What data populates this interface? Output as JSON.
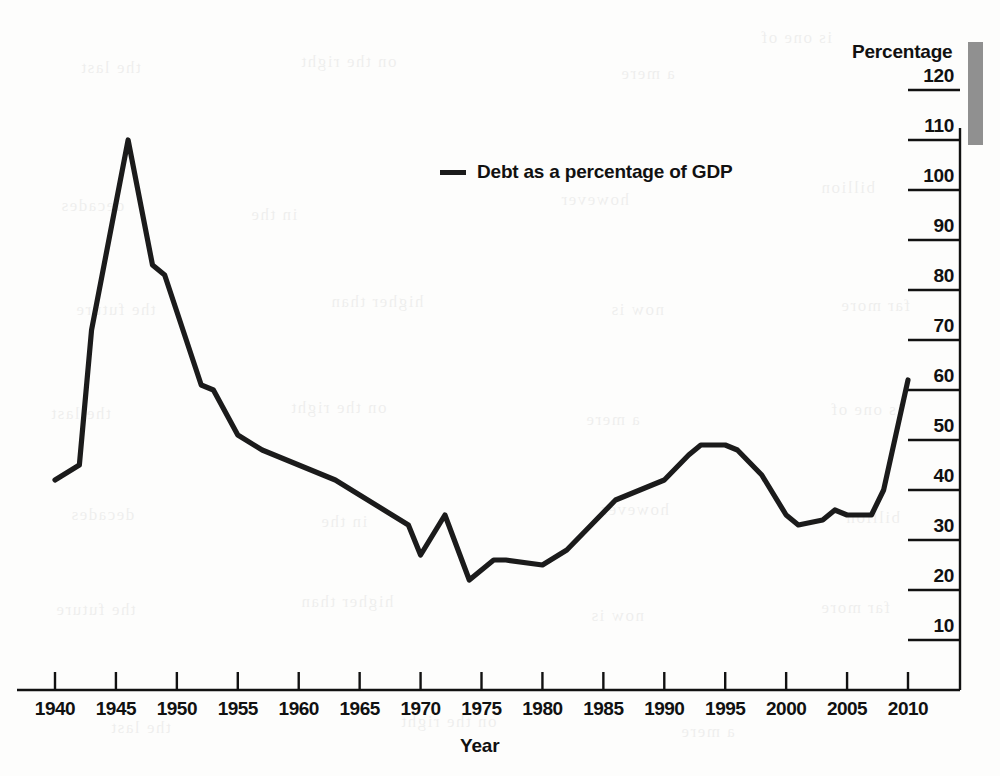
{
  "chart_data": {
    "type": "line",
    "title": "",
    "xlabel": "Year",
    "ylabel": "Percentage",
    "xlim": [
      1940,
      2010
    ],
    "ylim": [
      0,
      120
    ],
    "grid": false,
    "legend_position": "top-center",
    "xticks": [
      1940,
      1945,
      1950,
      1955,
      1960,
      1965,
      1970,
      1975,
      1980,
      1985,
      1990,
      1995,
      2000,
      2005,
      2010
    ],
    "yticks": [
      10,
      20,
      30,
      40,
      50,
      60,
      70,
      80,
      90,
      100,
      110,
      120
    ],
    "line_color": "#1b1b1b",
    "series": [
      {
        "name": "Debt as a percentage of GDP",
        "x": [
          1940,
          1942,
          1943,
          1946,
          1948,
          1949,
          1952,
          1953,
          1955,
          1957,
          1960,
          1963,
          1965,
          1967,
          1969,
          1970,
          1972,
          1974,
          1976,
          1977,
          1980,
          1982,
          1984,
          1986,
          1988,
          1990,
          1992,
          1993,
          1995,
          1996,
          1998,
          2000,
          2001,
          2003,
          2004,
          2005,
          2007,
          2008,
          2010
        ],
        "values": [
          42,
          45,
          72,
          110,
          85,
          83,
          61,
          60,
          51,
          48,
          45,
          42,
          39,
          36,
          33,
          27,
          35,
          22,
          26,
          26,
          25,
          28,
          33,
          38,
          40,
          42,
          47,
          49,
          49,
          48,
          43,
          35,
          33,
          34,
          36,
          35,
          35,
          40,
          62
        ]
      }
    ]
  },
  "axis": {
    "y_title": "Percentage",
    "x_title": "Year"
  },
  "legend": {
    "entries": [
      {
        "label": "Debt as a percentage of GDP",
        "marker": "line-swatch"
      }
    ]
  },
  "background_text": [
    "the last",
    "on the right",
    "a mere",
    "is one of",
    "decades",
    "in the",
    "however",
    "billion",
    "the future",
    "higher than",
    "now is",
    "far more"
  ]
}
